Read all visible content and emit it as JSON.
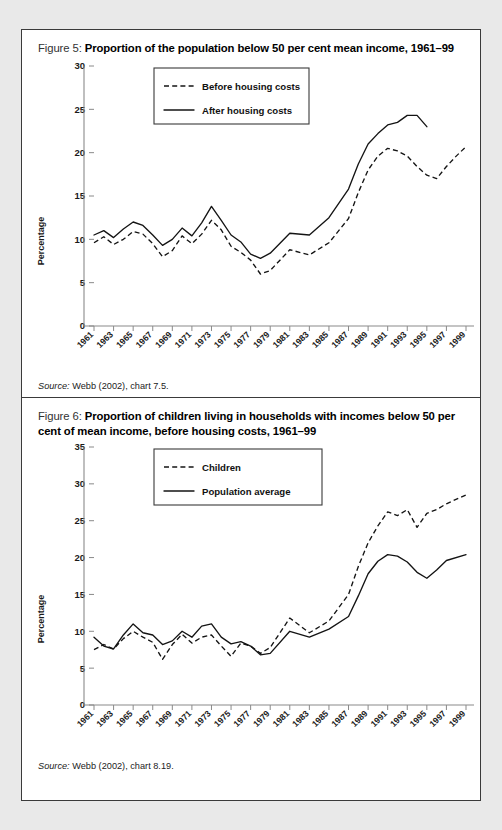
{
  "page": {
    "background": "#e9e9e9",
    "panel_background": "#ffffff",
    "border_color": "#3a3a3a"
  },
  "figures": [
    {
      "label": "Figure 5:",
      "title": "Proportion of the population below 50 per cent mean income, 1961–99",
      "source_prefix": "Source:",
      "source_text": " Webb (2002), chart 7.5.",
      "chart_data": {
        "type": "line",
        "title": "Proportion of the population below 50 per cent mean income, 1961–99",
        "xlabel": "",
        "ylabel": "Percentage",
        "ylim": [
          0,
          30
        ],
        "yticks": [
          0,
          5,
          10,
          15,
          20,
          25,
          30
        ],
        "xlim": [
          1961,
          1999
        ],
        "grid": false,
        "legend_position": "top-center",
        "xticks": [
          1961,
          1963,
          1965,
          1967,
          1969,
          1971,
          1973,
          1975,
          1977,
          1979,
          1981,
          1983,
          1985,
          1987,
          1989,
          1991,
          1993,
          1995,
          1997,
          1999
        ],
        "x": [
          1961,
          1962,
          1963,
          1964,
          1965,
          1966,
          1967,
          1968,
          1969,
          1970,
          1971,
          1972,
          1973,
          1974,
          1975,
          1976,
          1977,
          1978,
          1979,
          1981,
          1983,
          1985,
          1987,
          1988,
          1989,
          1990,
          1991,
          1992,
          1993,
          1994,
          1995,
          1996,
          1997,
          1998,
          1999
        ],
        "series": [
          {
            "name": "Before housing costs",
            "style": "dashed",
            "values": [
              9.6,
              10.3,
              9.4,
              10.0,
              10.9,
              10.6,
              9.5,
              8.0,
              8.7,
              10.4,
              9.5,
              10.6,
              12.2,
              11.1,
              9.2,
              8.5,
              7.6,
              6.0,
              6.4,
              8.8,
              8.2,
              9.6,
              12.4,
              15.4,
              18.0,
              19.6,
              20.5,
              20.2,
              19.6,
              18.4,
              17.4,
              17.0,
              18.4,
              19.6,
              20.7
            ]
          },
          {
            "name": "After housing costs",
            "style": "solid",
            "values": [
              10.5,
              11.0,
              10.2,
              11.2,
              12.0,
              11.6,
              10.5,
              9.3,
              10.0,
              11.3,
              10.4,
              11.9,
              13.8,
              12.2,
              10.5,
              9.7,
              8.3,
              7.8,
              8.4,
              10.7,
              10.5,
              12.5,
              15.8,
              18.7,
              21.0,
              22.2,
              23.2,
              23.5,
              24.3,
              24.3,
              23.0,
              null,
              null,
              null,
              null
            ]
          }
        ]
      }
    },
    {
      "label": "Figure 6:",
      "title": "Proportion of children living in households with incomes below 50 per cent of mean income, before housing costs, 1961–99",
      "source_prefix": "Source:",
      "source_text": " Webb (2002), chart 8.19.",
      "chart_data": {
        "type": "line",
        "title": "Proportion of children living in households with incomes below 50 per cent of mean income, before housing costs, 1961–99",
        "xlabel": "",
        "ylabel": "Percentage",
        "ylim": [
          0,
          35
        ],
        "yticks": [
          0,
          5,
          10,
          15,
          20,
          25,
          30,
          35
        ],
        "xlim": [
          1961,
          1999
        ],
        "grid": false,
        "legend_position": "top-center",
        "xticks": [
          1961,
          1963,
          1965,
          1967,
          1969,
          1971,
          1973,
          1975,
          1977,
          1979,
          1981,
          1983,
          1985,
          1987,
          1989,
          1991,
          1993,
          1995,
          1997,
          1999
        ],
        "x": [
          1961,
          1962,
          1963,
          1964,
          1965,
          1966,
          1967,
          1968,
          1969,
          1970,
          1971,
          1972,
          1973,
          1974,
          1975,
          1976,
          1977,
          1978,
          1979,
          1981,
          1983,
          1985,
          1987,
          1988,
          1989,
          1990,
          1991,
          1992,
          1993,
          1994,
          1995,
          1996,
          1997,
          1999
        ],
        "series": [
          {
            "name": "Children",
            "style": "dashed",
            "values": [
              7.5,
              8.2,
              7.6,
              9.0,
              10.0,
              9.2,
              8.5,
              6.2,
              8.2,
              9.6,
              8.4,
              9.2,
              9.5,
              8.0,
              6.6,
              8.4,
              8.0,
              7.0,
              7.8,
              11.8,
              9.8,
              11.4,
              15.0,
              18.8,
              22.0,
              24.3,
              26.2,
              25.7,
              26.5,
              24.1,
              26.0,
              26.5,
              27.3,
              28.5
            ]
          },
          {
            "name": "Population average",
            "style": "solid",
            "values": [
              9.2,
              8.0,
              7.6,
              9.5,
              11.0,
              9.8,
              9.5,
              8.2,
              8.7,
              10.0,
              9.2,
              10.7,
              11.0,
              9.2,
              8.3,
              8.6,
              8.0,
              6.8,
              7.0,
              10.0,
              9.2,
              10.3,
              12.0,
              14.8,
              17.8,
              19.5,
              20.4,
              20.2,
              19.4,
              18.0,
              17.2,
              18.3,
              19.6,
              20.4
            ]
          }
        ]
      }
    }
  ]
}
